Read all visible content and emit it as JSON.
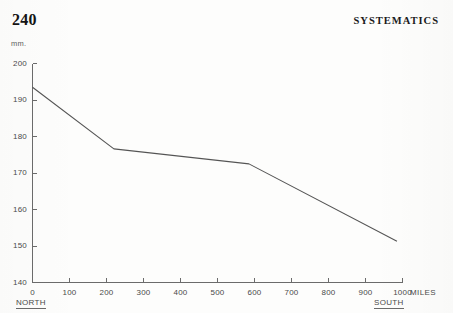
{
  "page": {
    "number": "240",
    "running_head": "SYSTEMATICS"
  },
  "chart_data": {
    "type": "line",
    "title": "",
    "xlabel": "MILES",
    "ylabel": "mm.",
    "x_unit_label": "MILES",
    "y_unit_label": "mm.",
    "xlim": [
      0,
      1000
    ],
    "ylim": [
      140,
      200
    ],
    "xticks": [
      0,
      100,
      200,
      300,
      400,
      500,
      600,
      700,
      800,
      900,
      1000
    ],
    "xtick_labels": [
      "0",
      "100",
      "200",
      "300",
      "400",
      "500",
      "600",
      "700",
      "800",
      "900",
      "1000"
    ],
    "yticks": [
      140,
      150,
      160,
      170,
      180,
      190,
      200
    ],
    "ytick_labels": [
      "140",
      "150",
      "160",
      "170",
      "180",
      "190",
      "200"
    ],
    "grid": false,
    "legend": "none",
    "direction_labels": {
      "left": "NORTH",
      "right": "SOUTH"
    },
    "series": [
      {
        "name": "wing length cline",
        "color": "#555555",
        "x": [
          0,
          220,
          585,
          985
        ],
        "values": [
          193.5,
          176.6,
          172.5,
          151.3
        ]
      }
    ]
  }
}
